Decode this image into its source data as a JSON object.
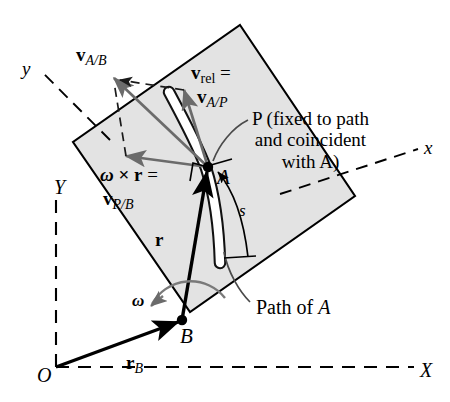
{
  "figure": {
    "colors": {
      "plate_fill": "#e3e3e3",
      "plate_stroke": "#000000",
      "vector_gray": "#666666",
      "vector_black": "#000000",
      "background": "#ffffff"
    }
  },
  "labels": {
    "v_ab": {
      "vec": "v",
      "sub": "A/B"
    },
    "v_rel": {
      "vec": "v",
      "sub": "rel",
      "equals": "="
    },
    "v_ap": {
      "vec": "v",
      "sub": "A/P"
    },
    "omega_cross_r": {
      "omega": "ω",
      "times": "×",
      "vec": "r",
      "equals": "="
    },
    "v_pb": {
      "vec": "v",
      "sub": "P/B"
    },
    "r_vector": {
      "vec": "r"
    },
    "r_b": {
      "vec": "r",
      "sub": "B"
    },
    "s": "s",
    "omega": "ω",
    "point_a": "A",
    "point_b": "B",
    "origin": "O",
    "path_of_a": "Path of A",
    "p_note_line1": "P (fixed to path",
    "p_note_line2": "and coincident",
    "p_note_line3": "with A)",
    "axis_x_lower": "x",
    "axis_y_lower": "y",
    "axis_x_upper": "X",
    "axis_y_upper": "Y"
  },
  "geometry": {
    "point_A": {
      "x": 208,
      "y": 167
    },
    "point_B": {
      "x": 182,
      "y": 320
    },
    "origin": {
      "x": 56,
      "y": 356
    },
    "plate_corners": [
      {
        "x": 240,
        "y": 25
      },
      {
        "x": 355,
        "y": 196
      },
      {
        "x": 190,
        "y": 312
      },
      {
        "x": 73,
        "y": 142
      }
    ]
  }
}
